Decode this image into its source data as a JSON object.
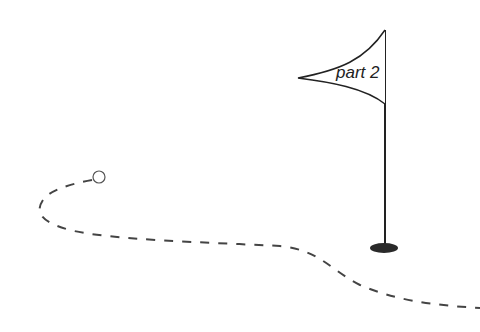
{
  "flag": {
    "label": "part 2"
  },
  "colors": {
    "stroke": "#333333",
    "hole": "#2a2a2a",
    "ball_fill": "#ffffff",
    "background": "#ffffff"
  }
}
